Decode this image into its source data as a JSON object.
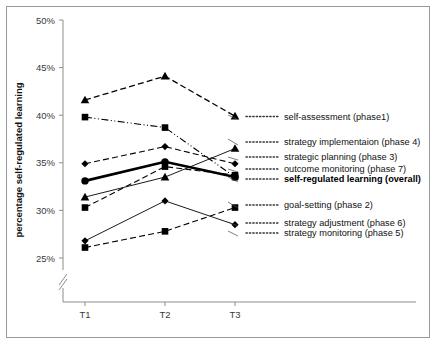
{
  "figure": {
    "border_color": "#9a9a9a",
    "background": "#ffffff"
  },
  "axes": {
    "ylabel": "percentage self-regulated  learning",
    "yticks": [
      "25%",
      "30%",
      "35%",
      "40%",
      "45%",
      "50%"
    ],
    "xticks": [
      "T1",
      "T2",
      "T3"
    ],
    "axis_break": true
  },
  "legend": {
    "items": [
      {
        "label": "self-assessment (phase1)",
        "bold": false
      },
      {
        "label": "strategy implementaion (phase 4)",
        "bold": false
      },
      {
        "label": "strategic planning (phase 3)",
        "bold": false
      },
      {
        "label": "outcome monitoring (phase 7)",
        "bold": false
      },
      {
        "label": "self-regulated learning (overall)",
        "bold": true
      },
      {
        "label": "goal-setting (phase 2)",
        "bold": false
      },
      {
        "label": "strategy adjustment (phase 6)",
        "bold": false
      },
      {
        "label": "strategy monitoring (phase 5)",
        "bold": false
      }
    ]
  },
  "chart_data": {
    "type": "line",
    "title": "",
    "xlabel": "",
    "ylabel": "percentage self-regulated  learning",
    "categories": [
      "T1",
      "T2",
      "T3"
    ],
    "ylim": [
      24,
      50
    ],
    "ytick_values": [
      25,
      30,
      35,
      40,
      45,
      50
    ],
    "grid": false,
    "legend_position": "right",
    "axis_break_below": 25,
    "series": [
      {
        "name": "self-assessment (phase1)",
        "marker": "triangle",
        "dash": "dashed",
        "width": 1.3,
        "values": [
          41.6,
          44.1,
          39.9
        ]
      },
      {
        "name": "strategy implementaion (phase 4)",
        "marker": "square",
        "dash": "dashdotdot",
        "width": 1.1,
        "values": [
          39.8,
          38.7,
          33.5
        ]
      },
      {
        "name": "strategic planning (phase 3)",
        "marker": "diamond",
        "dash": "dashed",
        "width": 1.1,
        "values": [
          34.9,
          36.7,
          34.9
        ]
      },
      {
        "name": "outcome monitoring (phase 7)",
        "marker": "square",
        "dash": "dashed",
        "width": 1.1,
        "values": [
          30.3,
          34.6,
          33.7
        ]
      },
      {
        "name": "self-regulated learning (overall)",
        "marker": "circle",
        "dash": "solid",
        "width": 2.6,
        "values": [
          33.1,
          35.1,
          33.5
        ]
      },
      {
        "name": "goal-setting (phase 2)",
        "marker": "square",
        "dash": "dashed",
        "width": 1.1,
        "values": [
          26.1,
          27.8,
          30.3
        ]
      },
      {
        "name": "strategy adjustment (phase 6)",
        "marker": "triangle",
        "dash": "solid",
        "width": 0.9,
        "values": [
          31.4,
          33.5,
          36.5
        ]
      },
      {
        "name": "strategy monitoring (phase 5)",
        "marker": "diamond",
        "dash": "solid",
        "width": 0.9,
        "values": [
          26.8,
          31.0,
          28.5
        ]
      }
    ]
  }
}
